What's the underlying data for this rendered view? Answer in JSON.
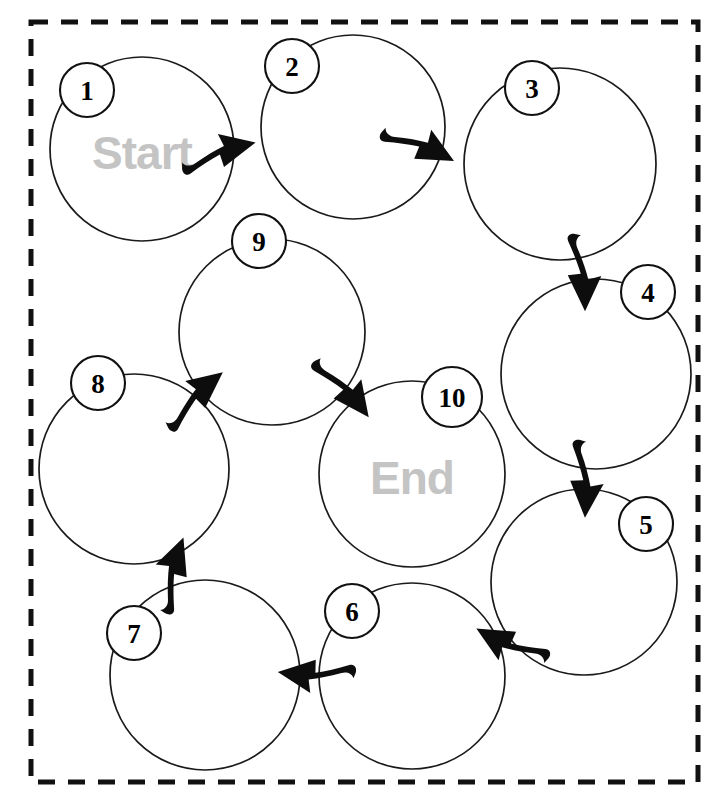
{
  "diagram": {
    "type": "cycle-flow-diagram",
    "frame": {
      "style": "dashed",
      "x": 31,
      "y": 22,
      "width": 667,
      "height": 760,
      "color": "#111111"
    },
    "colors": {
      "circle_stroke": "#1a1a1a",
      "badge_stroke": "#111111",
      "badge_text": "#000000",
      "label_text": "#c4c4c4",
      "arrow_fill": "#0d0d0d",
      "background": "#ffffff"
    },
    "nodes": [
      {
        "id": "node-1",
        "number": "1",
        "label": "Start",
        "cx": 142,
        "cy": 149,
        "r": 92,
        "badge_cx": 87,
        "badge_cy": 90,
        "badge_r": 27,
        "badge_font": 27,
        "label_font": 46
      },
      {
        "id": "node-2",
        "number": "2",
        "label": "",
        "cx": 353,
        "cy": 127,
        "r": 92,
        "badge_cx": 292,
        "badge_cy": 66,
        "badge_r": 27,
        "badge_font": 27,
        "label_font": 46
      },
      {
        "id": "node-3",
        "number": "3",
        "label": "",
        "cx": 560,
        "cy": 164,
        "r": 96,
        "badge_cx": 532,
        "badge_cy": 88,
        "badge_r": 27,
        "badge_font": 27,
        "label_font": 46
      },
      {
        "id": "node-4",
        "number": "4",
        "label": "",
        "cx": 596,
        "cy": 374,
        "r": 95,
        "badge_cx": 648,
        "badge_cy": 292,
        "badge_r": 27,
        "badge_font": 27,
        "label_font": 46
      },
      {
        "id": "node-5",
        "number": "5",
        "label": "",
        "cx": 584,
        "cy": 582,
        "r": 93,
        "badge_cx": 646,
        "badge_cy": 524,
        "badge_r": 27,
        "badge_font": 27,
        "label_font": 46
      },
      {
        "id": "node-6",
        "number": "6",
        "label": "",
        "cx": 412,
        "cy": 676,
        "r": 93,
        "badge_cx": 352,
        "badge_cy": 611,
        "badge_r": 27,
        "badge_font": 27,
        "label_font": 46
      },
      {
        "id": "node-7",
        "number": "7",
        "label": "",
        "cx": 205,
        "cy": 675,
        "r": 95,
        "badge_cx": 134,
        "badge_cy": 633,
        "badge_r": 27,
        "badge_font": 27,
        "label_font": 46
      },
      {
        "id": "node-8",
        "number": "8",
        "label": "",
        "cx": 134,
        "cy": 469,
        "r": 95,
        "badge_cx": 98,
        "badge_cy": 383,
        "badge_r": 27,
        "badge_font": 27,
        "label_font": 46
      },
      {
        "id": "node-9",
        "number": "9",
        "label": "",
        "cx": 272,
        "cy": 332,
        "r": 93,
        "badge_cx": 259,
        "badge_cy": 241,
        "badge_r": 27,
        "badge_font": 27,
        "label_font": 46
      },
      {
        "id": "node-10",
        "number": "10",
        "label": "End",
        "cx": 412,
        "cy": 474,
        "r": 93,
        "badge_cx": 452,
        "badge_cy": 397,
        "badge_r": 30,
        "badge_font": 27,
        "label_font": 46
      }
    ],
    "edges": [
      {
        "id": "edge-1-2",
        "from": "1",
        "to": "2",
        "direction": "right",
        "x": 225,
        "y": 144,
        "rotate": -14
      },
      {
        "id": "edge-2-3",
        "from": "2",
        "to": "3",
        "direction": "right-down",
        "x": 430,
        "y": 142,
        "rotate": 27
      },
      {
        "id": "edge-3-4",
        "from": "3",
        "to": "4",
        "direction": "down",
        "x": 590,
        "y": 281,
        "rotate": 88
      },
      {
        "id": "edge-4-5",
        "from": "4",
        "to": "5",
        "direction": "down",
        "x": 592,
        "y": 488,
        "rotate": 92
      },
      {
        "id": "edge-5-6",
        "from": "5",
        "to": "6",
        "direction": "left-down",
        "x": 500,
        "y": 648,
        "rotate": 208
      },
      {
        "id": "edge-6-7",
        "from": "6",
        "to": "7",
        "direction": "left",
        "x": 307,
        "y": 681,
        "rotate": 186
      },
      {
        "id": "edge-7-8",
        "from": "7",
        "to": "8",
        "direction": "up",
        "x": 168,
        "y": 564,
        "rotate": -71
      },
      {
        "id": "edge-8-9",
        "from": "8",
        "to": "9",
        "direction": "up-right",
        "x": 196,
        "y": 387,
        "rotate": -40
      },
      {
        "id": "edge-9-10",
        "from": "9",
        "to": "10",
        "direction": "down-right",
        "x": 355,
        "y": 390,
        "rotate": 52
      }
    ],
    "sequence": [
      "1",
      "2",
      "3",
      "4",
      "5",
      "6",
      "7",
      "8",
      "9",
      "10"
    ]
  }
}
